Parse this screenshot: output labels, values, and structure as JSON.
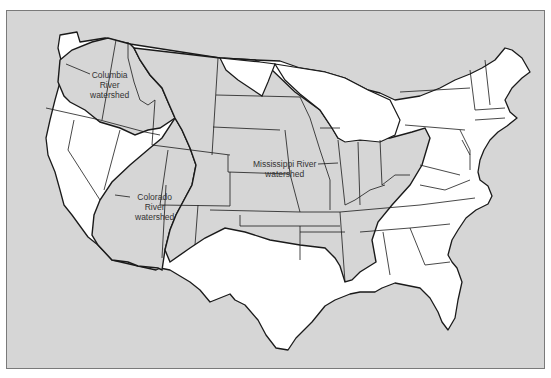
{
  "map": {
    "title": "",
    "background_color": "#d6d6d6",
    "watershed_fill": "#d6d6d6",
    "non_watershed_fill": "#ffffff",
    "stroke_color": "#1a1a1a",
    "labels": {
      "columbia": {
        "line1": "Columbia",
        "line2": "River",
        "line3": "watershed"
      },
      "mississippi": {
        "line1": "Mississippi River",
        "line2": "watershed"
      },
      "colorado": {
        "line1": "Colorado",
        "line2": "River",
        "line3": "watershed"
      }
    },
    "regions": [
      {
        "name": "Columbia River watershed",
        "shaded": true
      },
      {
        "name": "Mississippi River watershed",
        "shaded": true
      },
      {
        "name": "Colorado River watershed",
        "shaded": true
      }
    ]
  }
}
